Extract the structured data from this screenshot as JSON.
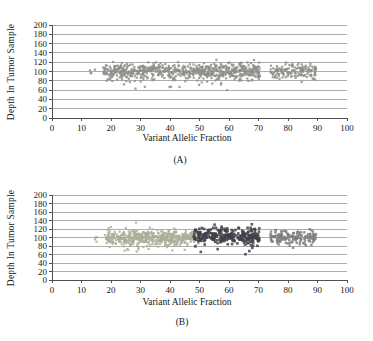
{
  "figure": {
    "background": "#ffffff",
    "grid_color": "#8a8a8a",
    "axis_color": "#4f4f4f",
    "text_color": "#161616"
  },
  "chart_data": [
    {
      "type": "scatter",
      "title": "(A)",
      "xlabel": "Variant Allelic Fraction",
      "ylabel": "Depth In Tumor Sample",
      "xlim": [
        0,
        100
      ],
      "ylim": [
        0,
        200
      ],
      "xticks": [
        0,
        10,
        20,
        30,
        40,
        50,
        60,
        70,
        80,
        90,
        100
      ],
      "yticks": [
        0,
        20,
        40,
        60,
        80,
        100,
        120,
        140,
        160,
        180,
        200
      ],
      "grid": "horizontal",
      "legend": "none",
      "series": [
        {
          "name": "all-variants-gray",
          "color": "#8e8e8a",
          "marker": "square",
          "size": 2.2,
          "clusters": [
            {
              "x_range": [
                12.5,
                17.5
              ],
              "y_mean": 99,
              "y_sd": 5,
              "n": 6
            },
            {
              "x_range": [
                17.5,
                70.5
              ],
              "y_mean": 100,
              "y_sd": 9,
              "n": 640
            },
            {
              "x_range": [
                20,
                62
              ],
              "y_mean": 71,
              "y_sd": 5,
              "n": 10
            },
            {
              "x_range": [
                74,
                89.5
              ],
              "y_mean": 100,
              "y_sd": 9,
              "n": 140
            }
          ]
        }
      ]
    },
    {
      "type": "scatter",
      "title": "(B)",
      "xlabel": "Variant Allelic Fraction",
      "ylabel": "Depth In Tumor Sample",
      "xlim": [
        0,
        100
      ],
      "ylim": [
        0,
        200
      ],
      "xticks": [
        0,
        10,
        20,
        30,
        40,
        50,
        60,
        70,
        80,
        90,
        100
      ],
      "yticks": [
        0,
        20,
        40,
        60,
        80,
        100,
        120,
        140,
        160,
        180,
        200
      ],
      "grid": "horizontal",
      "legend": "none",
      "series": [
        {
          "name": "cluster-low-vaf-green",
          "color": "#a8b098",
          "marker": "square",
          "size": 2.2,
          "clusters": [
            {
              "x_range": [
                13,
                18.5
              ],
              "y_mean": 97,
              "y_sd": 6,
              "n": 8
            },
            {
              "x_range": [
                18.5,
                50
              ],
              "y_mean": 100,
              "y_sd": 9,
              "n": 480
            },
            {
              "x_range": [
                21,
                45
              ],
              "y_mean": 74,
              "y_sd": 5,
              "n": 10
            }
          ]
        },
        {
          "name": "cluster-mid-vaf-dark",
          "color": "#3f4149",
          "marker": "square",
          "size": 2.6,
          "clusters": [
            {
              "x_range": [
                48,
                70.5
              ],
              "y_mean": 103,
              "y_sd": 10,
              "n": 270
            },
            {
              "x_range": [
                50,
                68
              ],
              "y_mean": 72,
              "y_sd": 5,
              "n": 5
            }
          ]
        },
        {
          "name": "cluster-high-vaf-gray",
          "color": "#7d7d81",
          "marker": "square",
          "size": 2.4,
          "clusters": [
            {
              "x_range": [
                74,
                89.5
              ],
              "y_mean": 100,
              "y_sd": 9,
              "n": 140
            }
          ]
        }
      ]
    }
  ]
}
